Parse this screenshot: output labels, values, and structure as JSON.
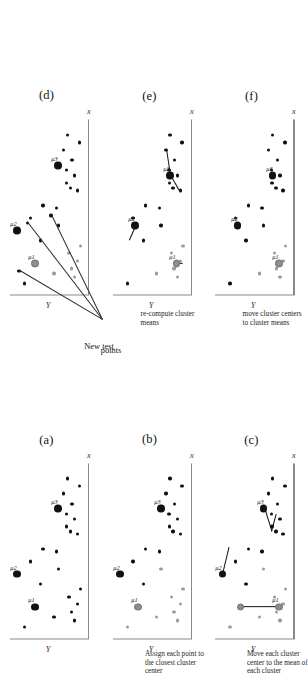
{
  "figure": {
    "orientation_deg": -90,
    "axis_x_label": "x",
    "axis_y_label": "Y",
    "colors": {
      "point_dark": "#111111",
      "point_gray": "#9b9b9b",
      "center_dark": "#111111",
      "center_gray": "#8e8e8e",
      "axis": "#8a8a8a",
      "background": "#ffffff"
    }
  },
  "annotations": {
    "new_test_points": "New test\npoints",
    "new_test_points_line1": "New test",
    "new_test_points_line2": "points"
  },
  "panels": [
    {
      "id": "a",
      "caption": "(a)",
      "step_text": "",
      "xlabel": "x",
      "ylabel": "Y",
      "centers": [
        {
          "cx": 26,
          "cy": 112,
          "color": "dark",
          "label": "μ1"
        },
        {
          "cx": 52,
          "cy": 150,
          "color": "dark",
          "label": "μ2"
        },
        {
          "cx": 104,
          "cy": 63,
          "color": "dark",
          "label": "μ3"
        }
      ],
      "points": [
        {
          "cx": 15,
          "cy": 28,
          "color": "dark"
        },
        {
          "cx": 22,
          "cy": 35,
          "color": "dark"
        },
        {
          "cx": 28,
          "cy": 22,
          "color": "dark"
        },
        {
          "cx": 34,
          "cy": 40,
          "color": "dark"
        },
        {
          "cx": 40,
          "cy": 16,
          "color": "dark"
        },
        {
          "cx": 18,
          "cy": 72,
          "color": "dark"
        },
        {
          "cx": 56,
          "cy": 63,
          "color": "dark"
        },
        {
          "cx": 70,
          "cy": 66,
          "color": "dark"
        },
        {
          "cx": 72,
          "cy": 95,
          "color": "dark"
        },
        {
          "cx": 62,
          "cy": 122,
          "color": "dark"
        },
        {
          "cx": 86,
          "cy": 37,
          "color": "dark"
        },
        {
          "cx": 90,
          "cy": 45,
          "color": "dark"
        },
        {
          "cx": 96,
          "cy": 28,
          "color": "dark"
        },
        {
          "cx": 100,
          "cy": 46,
          "color": "dark"
        },
        {
          "cx": 108,
          "cy": 34,
          "color": "dark"
        },
        {
          "cx": 84,
          "cy": 22,
          "color": "dark"
        },
        {
          "cx": 116,
          "cy": 52,
          "color": "dark"
        },
        {
          "cx": 122,
          "cy": 18,
          "color": "dark"
        },
        {
          "cx": 128,
          "cy": 44,
          "color": "dark"
        },
        {
          "cx": 44,
          "cy": 100,
          "color": "dark"
        },
        {
          "cx": 10,
          "cy": 134,
          "color": "dark"
        }
      ],
      "segments": []
    },
    {
      "id": "b",
      "caption": "(b)",
      "step_text": "Assign each point to the closest cluster center",
      "xlabel": "x",
      "ylabel": "Y",
      "centers": [
        {
          "cx": 26,
          "cy": 112,
          "color": "gray",
          "label": "μ1"
        },
        {
          "cx": 52,
          "cy": 150,
          "color": "dark",
          "label": "μ2"
        },
        {
          "cx": 104,
          "cy": 63,
          "color": "dark",
          "label": "μ3"
        }
      ],
      "points": [
        {
          "cx": 15,
          "cy": 28,
          "color": "gray"
        },
        {
          "cx": 22,
          "cy": 35,
          "color": "gray"
        },
        {
          "cx": 28,
          "cy": 22,
          "color": "gray"
        },
        {
          "cx": 34,
          "cy": 40,
          "color": "gray"
        },
        {
          "cx": 40,
          "cy": 16,
          "color": "gray"
        },
        {
          "cx": 18,
          "cy": 72,
          "color": "gray"
        },
        {
          "cx": 56,
          "cy": 63,
          "color": "gray"
        },
        {
          "cx": 70,
          "cy": 66,
          "color": "dark"
        },
        {
          "cx": 72,
          "cy": 95,
          "color": "dark"
        },
        {
          "cx": 62,
          "cy": 122,
          "color": "dark"
        },
        {
          "cx": 86,
          "cy": 37,
          "color": "dark"
        },
        {
          "cx": 90,
          "cy": 45,
          "color": "dark"
        },
        {
          "cx": 96,
          "cy": 28,
          "color": "dark"
        },
        {
          "cx": 100,
          "cy": 46,
          "color": "dark"
        },
        {
          "cx": 108,
          "cy": 34,
          "color": "dark"
        },
        {
          "cx": 84,
          "cy": 22,
          "color": "dark"
        },
        {
          "cx": 116,
          "cy": 52,
          "color": "dark"
        },
        {
          "cx": 122,
          "cy": 18,
          "color": "dark"
        },
        {
          "cx": 128,
          "cy": 44,
          "color": "dark"
        },
        {
          "cx": 44,
          "cy": 100,
          "color": "dark"
        },
        {
          "cx": 10,
          "cy": 134,
          "color": "gray"
        }
      ],
      "segments": []
    },
    {
      "id": "c",
      "caption": "(c)",
      "step_text": "Move each cluster center to the mean of each cluster",
      "xlabel": "x",
      "ylabel": "Y",
      "centers": [
        {
          "cx": 26,
          "cy": 30,
          "color": "gray",
          "label": "μ1"
        },
        {
          "cx": 26,
          "cy": 112,
          "color": "gray",
          "label": ""
        },
        {
          "cx": 52,
          "cy": 150,
          "color": "dark",
          "label": "μ2"
        },
        {
          "cx": 104,
          "cy": 63,
          "color": "dark",
          "label": "μ3"
        }
      ],
      "points": [
        {
          "cx": 15,
          "cy": 28,
          "color": "gray"
        },
        {
          "cx": 22,
          "cy": 35,
          "color": "gray"
        },
        {
          "cx": 28,
          "cy": 22,
          "color": "gray"
        },
        {
          "cx": 34,
          "cy": 40,
          "color": "gray"
        },
        {
          "cx": 40,
          "cy": 16,
          "color": "gray"
        },
        {
          "cx": 18,
          "cy": 72,
          "color": "gray"
        },
        {
          "cx": 56,
          "cy": 63,
          "color": "gray"
        },
        {
          "cx": 70,
          "cy": 66,
          "color": "dark"
        },
        {
          "cx": 72,
          "cy": 95,
          "color": "dark"
        },
        {
          "cx": 62,
          "cy": 122,
          "color": "dark"
        },
        {
          "cx": 86,
          "cy": 37,
          "color": "dark"
        },
        {
          "cx": 90,
          "cy": 45,
          "color": "dark"
        },
        {
          "cx": 96,
          "cy": 28,
          "color": "dark"
        },
        {
          "cx": 100,
          "cy": 46,
          "color": "dark"
        },
        {
          "cx": 108,
          "cy": 34,
          "color": "dark"
        },
        {
          "cx": 84,
          "cy": 22,
          "color": "dark"
        },
        {
          "cx": 116,
          "cy": 52,
          "color": "dark"
        },
        {
          "cx": 122,
          "cy": 18,
          "color": "dark"
        },
        {
          "cx": 128,
          "cy": 44,
          "color": "dark"
        },
        {
          "cx": 44,
          "cy": 100,
          "color": "dark"
        },
        {
          "cx": 10,
          "cy": 134,
          "color": "gray"
        }
      ],
      "segments": [
        {
          "x1": 26,
          "y1": 30,
          "x2": 26,
          "y2": 112,
          "weight": "thick"
        },
        {
          "x1": 52,
          "y1": 150,
          "x2": 74,
          "y2": 136,
          "weight": "thick"
        },
        {
          "x1": 104,
          "y1": 63,
          "x2": 86,
          "y2": 48,
          "weight": "thick"
        },
        {
          "x1": 86,
          "y1": 48,
          "x2": 100,
          "y2": 38,
          "weight": "thick"
        }
      ]
    },
    {
      "id": "d",
      "caption": "(d)",
      "step_text": "",
      "xlabel": "x",
      "ylabel": "Y",
      "centers": [
        {
          "cx": 26,
          "cy": 112,
          "color": "gray",
          "label": "μ1"
        },
        {
          "cx": 52,
          "cy": 150,
          "color": "dark",
          "label": "μ2"
        },
        {
          "cx": 104,
          "cy": 63,
          "color": "dark",
          "label": "μ3"
        }
      ],
      "points": [
        {
          "cx": 15,
          "cy": 28,
          "color": "gray"
        },
        {
          "cx": 22,
          "cy": 35,
          "color": "gray"
        },
        {
          "cx": 28,
          "cy": 22,
          "color": "gray"
        },
        {
          "cx": 34,
          "cy": 40,
          "color": "gray"
        },
        {
          "cx": 40,
          "cy": 16,
          "color": "gray"
        },
        {
          "cx": 18,
          "cy": 72,
          "color": "gray"
        },
        {
          "cx": 56,
          "cy": 63,
          "color": "dark"
        },
        {
          "cx": 70,
          "cy": 66,
          "color": "dark"
        },
        {
          "cx": 72,
          "cy": 95,
          "color": "dark"
        },
        {
          "cx": 62,
          "cy": 122,
          "color": "dark"
        },
        {
          "cx": 86,
          "cy": 37,
          "color": "dark"
        },
        {
          "cx": 90,
          "cy": 45,
          "color": "dark"
        },
        {
          "cx": 96,
          "cy": 28,
          "color": "dark"
        },
        {
          "cx": 100,
          "cy": 46,
          "color": "dark"
        },
        {
          "cx": 108,
          "cy": 34,
          "color": "dark"
        },
        {
          "cx": 84,
          "cy": 22,
          "color": "dark"
        },
        {
          "cx": 116,
          "cy": 52,
          "color": "dark"
        },
        {
          "cx": 122,
          "cy": 18,
          "color": "dark"
        },
        {
          "cx": 128,
          "cy": 44,
          "color": "dark"
        },
        {
          "cx": 44,
          "cy": 100,
          "color": "dark"
        },
        {
          "cx": 10,
          "cy": 134,
          "color": "dark"
        }
      ],
      "test_points": [
        {
          "cx": 64,
          "cy": 78
        },
        {
          "cx": 58,
          "cy": 128
        },
        {
          "cx": 20,
          "cy": 146
        }
      ],
      "segments": []
    },
    {
      "id": "e",
      "caption": "(e)",
      "step_text": "re-compute cluster means",
      "xlabel": "x",
      "ylabel": "Y",
      "centers": [
        {
          "cx": 26,
          "cy": 30,
          "color": "gray",
          "label": "μ1"
        },
        {
          "cx": 56,
          "cy": 118,
          "color": "dark",
          "label": "μ2"
        },
        {
          "cx": 96,
          "cy": 44,
          "color": "dark",
          "label": "μ3"
        }
      ],
      "points": [
        {
          "cx": 15,
          "cy": 28,
          "color": "gray"
        },
        {
          "cx": 22,
          "cy": 35,
          "color": "gray"
        },
        {
          "cx": 28,
          "cy": 22,
          "color": "gray"
        },
        {
          "cx": 34,
          "cy": 40,
          "color": "gray"
        },
        {
          "cx": 40,
          "cy": 16,
          "color": "gray"
        },
        {
          "cx": 18,
          "cy": 72,
          "color": "gray"
        },
        {
          "cx": 56,
          "cy": 63,
          "color": "dark"
        },
        {
          "cx": 70,
          "cy": 66,
          "color": "dark"
        },
        {
          "cx": 72,
          "cy": 95,
          "color": "dark"
        },
        {
          "cx": 62,
          "cy": 122,
          "color": "dark"
        },
        {
          "cx": 86,
          "cy": 37,
          "color": "dark"
        },
        {
          "cx": 90,
          "cy": 45,
          "color": "dark"
        },
        {
          "cx": 96,
          "cy": 28,
          "color": "dark"
        },
        {
          "cx": 100,
          "cy": 46,
          "color": "dark"
        },
        {
          "cx": 108,
          "cy": 34,
          "color": "dark"
        },
        {
          "cx": 84,
          "cy": 22,
          "color": "dark"
        },
        {
          "cx": 116,
          "cy": 52,
          "color": "dark"
        },
        {
          "cx": 122,
          "cy": 18,
          "color": "dark"
        },
        {
          "cx": 128,
          "cy": 44,
          "color": "dark"
        },
        {
          "cx": 44,
          "cy": 100,
          "color": "dark"
        },
        {
          "cx": 10,
          "cy": 134,
          "color": "dark"
        }
      ],
      "segments": [
        {
          "x1": 26,
          "y1": 30,
          "x2": 26,
          "y2": 18,
          "weight": "thick"
        },
        {
          "x1": 56,
          "y1": 118,
          "x2": 44,
          "y2": 132,
          "weight": "thick"
        },
        {
          "x1": 96,
          "y1": 44,
          "x2": 116,
          "y2": 52,
          "weight": "thick"
        },
        {
          "x1": 96,
          "y1": 44,
          "x2": 84,
          "y2": 26,
          "weight": "thick"
        }
      ]
    },
    {
      "id": "f",
      "caption": "(f)",
      "step_text": "move cluster centers to cluster means",
      "xlabel": "x",
      "ylabel": "Y",
      "centers": [
        {
          "cx": 26,
          "cy": 30,
          "color": "gray",
          "label": "μ1"
        },
        {
          "cx": 56,
          "cy": 118,
          "color": "dark",
          "label": "μ2"
        },
        {
          "cx": 96,
          "cy": 44,
          "color": "dark",
          "label": "μ3"
        }
      ],
      "points": [
        {
          "cx": 15,
          "cy": 28,
          "color": "gray"
        },
        {
          "cx": 22,
          "cy": 35,
          "color": "gray"
        },
        {
          "cx": 28,
          "cy": 22,
          "color": "gray"
        },
        {
          "cx": 34,
          "cy": 40,
          "color": "gray"
        },
        {
          "cx": 40,
          "cy": 16,
          "color": "gray"
        },
        {
          "cx": 18,
          "cy": 72,
          "color": "gray"
        },
        {
          "cx": 56,
          "cy": 63,
          "color": "dark"
        },
        {
          "cx": 70,
          "cy": 66,
          "color": "dark"
        },
        {
          "cx": 72,
          "cy": 95,
          "color": "dark"
        },
        {
          "cx": 62,
          "cy": 122,
          "color": "dark"
        },
        {
          "cx": 86,
          "cy": 37,
          "color": "dark"
        },
        {
          "cx": 90,
          "cy": 45,
          "color": "dark"
        },
        {
          "cx": 96,
          "cy": 28,
          "color": "dark"
        },
        {
          "cx": 100,
          "cy": 46,
          "color": "dark"
        },
        {
          "cx": 108,
          "cy": 34,
          "color": "dark"
        },
        {
          "cx": 84,
          "cy": 22,
          "color": "dark"
        },
        {
          "cx": 116,
          "cy": 52,
          "color": "dark"
        },
        {
          "cx": 122,
          "cy": 18,
          "color": "dark"
        },
        {
          "cx": 128,
          "cy": 44,
          "color": "dark"
        },
        {
          "cx": 44,
          "cy": 100,
          "color": "dark"
        },
        {
          "cx": 10,
          "cy": 134,
          "color": "dark"
        }
      ],
      "segments": []
    }
  ]
}
